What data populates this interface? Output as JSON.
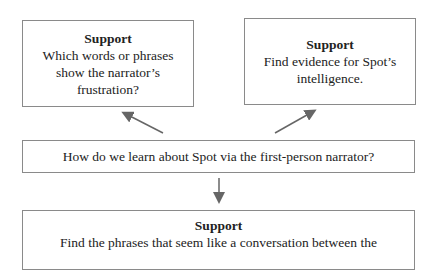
{
  "center": {
    "question": "How do we learn about Spot via the first-person narrator?"
  },
  "supports": [
    {
      "title": "Support",
      "text_lines": [
        "Which words or phrases",
        "show the narrator’s",
        "frustration?"
      ]
    },
    {
      "title": "Support",
      "text_lines": [
        "Find evidence for Spot’s",
        "intelligence."
      ]
    },
    {
      "title": "Support",
      "text_lines": [
        "Find the phrases that seem like a conversation between the"
      ]
    }
  ],
  "colors": {
    "border": "#8a8a8a",
    "arrow": "#666666",
    "text": "#222222"
  }
}
